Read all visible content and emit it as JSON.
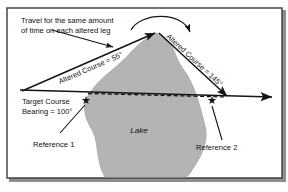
{
  "figure": {
    "name": "navigation-altered-course-diagram",
    "frame": {
      "border_color": "#3a3a3a",
      "background": "#ffffff"
    },
    "colors": {
      "lake_fill": "#b4b4b4",
      "lake_stroke": "#9a9a9a",
      "line": "#141414",
      "text": "#111111",
      "border": "#3a3a3a"
    },
    "annotations": {
      "note_line1": "Travel for the same amount",
      "note_line2": "of time on each altered leg",
      "altered_course_left": "Altered Course = 55°",
      "altered_course_right": "Altered Course = 145°",
      "target_course_line1": "Target Course",
      "target_course_line2": "Bearing = 100°",
      "reference_1": "Reference 1",
      "reference_2": "Reference 2",
      "lake_label": "Lake"
    },
    "geometry": {
      "origin": {
        "x": 20,
        "y": 90
      },
      "apex": {
        "x": 157,
        "y": 31
      },
      "rejoin": {
        "x": 228,
        "y": 97
      },
      "arrow_end": {
        "x": 272,
        "y": 97
      },
      "star_1": {
        "x": 86,
        "y": 101
      },
      "star_2": {
        "x": 212,
        "y": 101
      }
    },
    "markers": {
      "star_glyph": "★",
      "star_count": 2
    }
  }
}
